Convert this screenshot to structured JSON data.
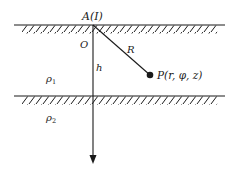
{
  "diagram": {
    "colors": {
      "stroke": "#1a1a1a",
      "background": "#ffffff"
    },
    "labels": {
      "source": "A(I)",
      "origin": "O",
      "distance": "R",
      "point": "P(r, φ, z)",
      "depth": "h",
      "layer1_density": "ρ",
      "layer1_sub": "1",
      "layer2_density": "ρ",
      "layer2_sub": "2"
    },
    "elements": {
      "surface_line": {
        "y": 25,
        "x1": 14,
        "x2": 225,
        "hatched": true
      },
      "interface_line": {
        "y": 96,
        "x1": 14,
        "x2": 225,
        "hatched": true
      },
      "vertical_axis": {
        "x": 93,
        "y1": 25,
        "y2": 163,
        "arrow": "down"
      },
      "radius_line": {
        "from": [
          93,
          25
        ],
        "to": [
          150,
          75
        ]
      },
      "point_P": {
        "x": 150,
        "y": 75
      }
    }
  }
}
